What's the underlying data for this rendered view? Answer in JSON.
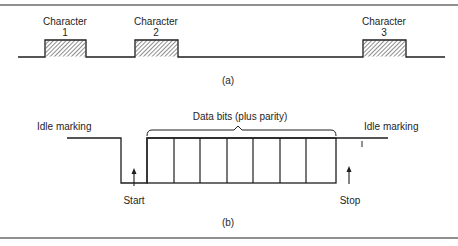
{
  "figure": {
    "panel_a": {
      "caption": "(a)",
      "characters": [
        {
          "label": "Character",
          "number": "1"
        },
        {
          "label": "Character",
          "number": "2"
        },
        {
          "label": "Character",
          "number": "3"
        }
      ]
    },
    "panel_b": {
      "caption": "(b)",
      "idle_left_label": "Idle marking",
      "idle_right_label": "Idle marking",
      "data_bits_label": "Data bits (plus parity)",
      "start_label": "Start",
      "stop_label": "Stop",
      "data_bit_cells": 7
    },
    "colors": {
      "line": "#1e1e1e",
      "frame": "#6b6b6b",
      "background": "#ffffff"
    }
  }
}
